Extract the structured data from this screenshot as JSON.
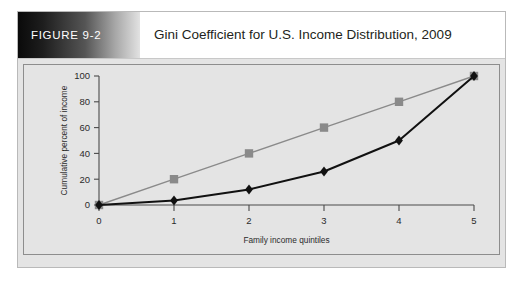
{
  "figure": {
    "label": "FIGURE 9-2",
    "title": "Gini Coefficient for U.S. Income Distribution, 2009"
  },
  "colors": {
    "equality_line": "#8a8a8a",
    "lorenz_line": "#111111",
    "plot_background": "#e4e4e4",
    "page_background": "#ffffff",
    "axis": "#4a4a4a",
    "label_band_dark": "#0a0a0a"
  },
  "chart_data": {
    "type": "line",
    "title": "Gini Coefficient for U.S. Income Distribution, 2009",
    "xlabel": "Family income quintiles",
    "ylabel": "Cumulative percent of income",
    "x": [
      0,
      1,
      2,
      3,
      4,
      5
    ],
    "xticks": [
      "0",
      "1",
      "2",
      "3",
      "4",
      "5"
    ],
    "yticks": [
      "0",
      "20",
      "40",
      "60",
      "80",
      "100"
    ],
    "xlim": [
      0,
      5
    ],
    "ylim": [
      0,
      100
    ],
    "grid": false,
    "legend": "none",
    "series": [
      {
        "name": "Line of equality",
        "color": "#8a8a8a",
        "marker": "square",
        "values": [
          0,
          20,
          40,
          60,
          80,
          100
        ]
      },
      {
        "name": "Lorenz curve",
        "color": "#111111",
        "marker": "diamond",
        "values": [
          0,
          3.4,
          12,
          26,
          50,
          100
        ]
      }
    ]
  }
}
